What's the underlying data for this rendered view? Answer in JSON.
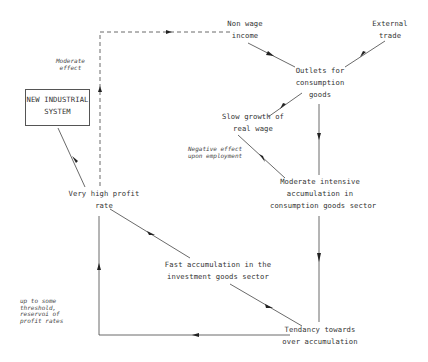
{
  "diagram": {
    "nodes": {
      "non_wage_income": "Non wage\nincome",
      "external_trade": "External\ntrade",
      "outlets": "Outlets for\nconsumption\ngoods",
      "slow_growth": "Slow growth of\nreal wage",
      "new_industrial_system": "NEW INDUSTRIAL\nSYSTEM",
      "very_high_profit": "Very high profit\nrate",
      "moderate_accumulation": "Moderate intensive\naccumulation in\nconsumption goods sector",
      "fast_accumulation": "Fast accumulation in the\ninvestment goods sector",
      "tendancy": "Tendancy towards\nover accumulation"
    },
    "annotations": {
      "moderate_effect": "Moderate\neffect",
      "negative_effect": "Negative effect\nupon employment",
      "threshold": "up to some\nthreshold,\nreservoi of\nprofit rates"
    },
    "edges": [
      {
        "from": "very_high_profit",
        "to": "non_wage_income",
        "style": "dashed",
        "label": "Moderate effect"
      },
      {
        "from": "non_wage_income",
        "to": "outlets",
        "style": "solid"
      },
      {
        "from": "external_trade",
        "to": "outlets",
        "style": "solid"
      },
      {
        "from": "outlets",
        "to": "slow_growth",
        "style": "solid"
      },
      {
        "from": "outlets",
        "to": "moderate_accumulation",
        "style": "solid"
      },
      {
        "from": "moderate_accumulation",
        "to": "slow_growth",
        "style": "solid",
        "label": "Negative effect upon employment"
      },
      {
        "from": "very_high_profit",
        "to": "new_industrial_system",
        "style": "solid"
      },
      {
        "from": "very_high_profit",
        "to": "fast_accumulation",
        "style": "solid"
      },
      {
        "from": "moderate_accumulation",
        "to": "tendancy",
        "style": "solid"
      },
      {
        "from": "fast_accumulation",
        "to": "tendancy",
        "style": "solid"
      },
      {
        "from": "tendancy",
        "to": "very_high_profit",
        "style": "solid",
        "label": "up to some threshold, reservoi of profit rates"
      }
    ]
  }
}
